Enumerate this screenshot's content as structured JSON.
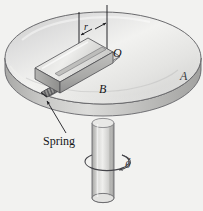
{
  "figure": {
    "background_color": "#f2f2f0",
    "width": 203,
    "height": 211,
    "labels": {
      "center_point": "O",
      "slider_block": "B",
      "disk": "A",
      "radius": "r",
      "spring": "Spring",
      "angular_rate": "θ",
      "angular_rate_dot": "˙",
      "angular_rate_full": "θ̇"
    },
    "components": [
      {
        "name": "disk",
        "label": "A",
        "description": "large horizontal circular disk shown in perspective as an ellipse with a thick rim"
      },
      {
        "name": "shaft",
        "label": "",
        "description": "vertical cylindrical shaft supporting the disk from below"
      },
      {
        "name": "guide-rod",
        "label": "",
        "description": "horizontal rod through center O along which the slider moves"
      },
      {
        "name": "slider-block",
        "label": "B",
        "description": "rectangular block riding on the guide rod"
      },
      {
        "name": "spring",
        "label": "Spring",
        "description": "coil spring drawn with diagonal hatching connecting slider to rod end"
      },
      {
        "name": "radius-dimension",
        "label": "r",
        "description": "double headed dimension arrow between slider and center line"
      },
      {
        "name": "rotation-arrow",
        "label": "θ̇",
        "description": "elliptical arrow around the shaft indicating angular velocity"
      }
    ],
    "colors": {
      "disk_top": "#e9e9e7",
      "disk_rim": "#b8b8b6",
      "shaft": "#d8d8d6",
      "block": "#c9c9c7",
      "line": "#2a2a2e",
      "label": "#16161a"
    }
  }
}
